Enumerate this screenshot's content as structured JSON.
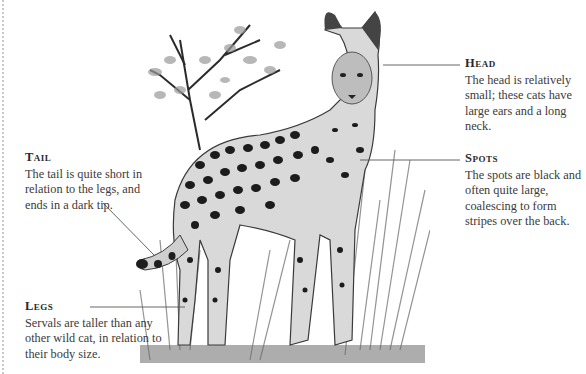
{
  "illustration": {
    "subject": "serval-cat-illustration",
    "style": "grayscale engraving"
  },
  "callouts": {
    "head": {
      "title": "Head",
      "body": "The head is relatively small; these cats have large ears and a long neck."
    },
    "spots": {
      "title": "Spots",
      "body": "The spots are black and often quite large, coalescing to form stripes over the back."
    },
    "tail": {
      "title": "Tail",
      "body": "The tail is quite short in relation to the legs, and ends in a dark tip."
    },
    "legs": {
      "title": "Legs",
      "body": "Servals are taller than any other wild cat, in relation to their body size."
    }
  },
  "colors": {
    "text": "#3b3b3b",
    "leader": "#555555",
    "background": "#ffffff"
  }
}
